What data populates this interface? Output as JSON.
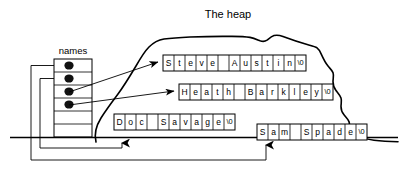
{
  "diagram": {
    "title": "The heap",
    "array_label": "names",
    "baseline_name": "stack-baseline"
  },
  "array": {
    "label": "names",
    "x": 54,
    "y": 59,
    "cell_w": 38,
    "cell_h": 13,
    "cells": [
      {
        "index": 0,
        "filled": true,
        "target": "Sam Spade"
      },
      {
        "index": 1,
        "filled": true,
        "target": "Doc Savage"
      },
      {
        "index": 2,
        "filled": true,
        "target": "Steve Austin"
      },
      {
        "index": 3,
        "filled": true,
        "target": "Heath Barkley"
      },
      {
        "index": 4,
        "filled": false,
        "target": ""
      },
      {
        "index": 5,
        "filled": false,
        "target": ""
      }
    ]
  },
  "strings": [
    {
      "id": "steve-austin",
      "text": "Steve Austin",
      "chars": [
        "S",
        "t",
        "e",
        "v",
        "e",
        " ",
        "A",
        "u",
        "s",
        "t",
        "i",
        "n",
        "\\0"
      ],
      "x": 163,
      "y": 55,
      "cell_w": 11,
      "cell_h": 16,
      "in_heap": true
    },
    {
      "id": "heath-barkley",
      "text": "Heath Barkley",
      "chars": [
        "H",
        "e",
        "a",
        "t",
        "h",
        " ",
        "B",
        "a",
        "r",
        "k",
        "l",
        "e",
        "y",
        "\\0"
      ],
      "x": 179,
      "y": 84,
      "cell_w": 11,
      "cell_h": 16,
      "in_heap": true
    },
    {
      "id": "doc-savage",
      "text": "Doc Savage",
      "chars": [
        "D",
        "o",
        "c",
        " ",
        "S",
        "a",
        "v",
        "a",
        "g",
        "e",
        "\\0"
      ],
      "x": 114,
      "y": 114,
      "cell_w": 11,
      "cell_h": 16,
      "in_heap": true
    },
    {
      "id": "sam-spade",
      "text": "Sam Spade",
      "chars": [
        "S",
        "a",
        "m",
        " ",
        "S",
        "p",
        "a",
        "d",
        "e",
        "\\0"
      ],
      "x": 257,
      "y": 124,
      "cell_w": 11,
      "cell_h": 16,
      "in_heap": true
    }
  ],
  "colors": {
    "ink": "#000000",
    "paper": "#ffffff",
    "dot": "#111111"
  }
}
